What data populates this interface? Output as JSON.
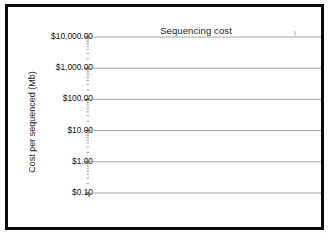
{
  "figure": {
    "title": "Sequencing cost",
    "frame_color": "#0a0a0a",
    "background": "#ffffff"
  },
  "axes": {
    "ylabel": "Cost per sequenced (Mb)",
    "xlabel": "",
    "y_ticklabels": [
      "$10,000.00",
      "$1,000.00",
      "$100.00",
      "$10.00",
      "$1.00",
      "$0.10"
    ],
    "x_ticklabels": [
      "2001",
      "2002",
      "2003",
      "2004",
      "2005",
      "2006",
      "2007",
      "2008",
      "2009",
      "2010"
    ],
    "y_scale": "log",
    "grid": "horizontal"
  },
  "chart_data": {
    "type": "line",
    "title": "Sequencing cost",
    "xlabel": "",
    "ylabel": "Cost per sequenced (Mb)",
    "yscale": "log",
    "ylim": [
      0.1,
      10000
    ],
    "xlim": [
      2001,
      2010.9
    ],
    "grid": true,
    "legend": "none",
    "y_ticks": [
      10000,
      1000,
      100,
      10,
      1,
      0.1
    ],
    "y_ticklabels": [
      "$10,000.00",
      "$1,000.00",
      "$100.00",
      "$10.00",
      "$1.00",
      "$0.10"
    ],
    "x_ticks": [
      2001,
      2002,
      2003,
      2004,
      2005,
      2006,
      2007,
      2008,
      2009,
      2010
    ],
    "series": [
      {
        "name": "Moore's Law trend",
        "color": "#8c8c8c",
        "style": "straight-line",
        "linewidth": 3.2,
        "x": [
          2001.1,
          2010.9
        ],
        "values": [
          5200,
          170
        ]
      },
      {
        "name": "Cost per Mb of DNA sequence",
        "color": "#1a1a1a",
        "style": "line",
        "linewidth": 3.4,
        "x": [
          2001.1,
          2001.6,
          2002.1,
          2002.6,
          2003.1,
          2003.35,
          2003.5,
          2003.9,
          2004.4,
          2005.0,
          2005.5,
          2006.0,
          2006.5,
          2006.9,
          2007.1,
          2007.25,
          2007.45,
          2007.6,
          2007.8,
          2008.1,
          2008.5,
          2009.0,
          2009.4,
          2009.8,
          2010.1,
          2010.4,
          2010.7,
          2010.9
        ],
        "values": [
          5200,
          4100,
          3200,
          2500,
          1900,
          1750,
          1150,
          1020,
          900,
          780,
          690,
          600,
          500,
          420,
          400,
          260,
          60,
          13,
          9,
          5.2,
          2.6,
          1.1,
          0.62,
          0.33,
          0.32,
          0.31,
          0.2,
          0.105
        ]
      }
    ],
    "annotations": []
  }
}
